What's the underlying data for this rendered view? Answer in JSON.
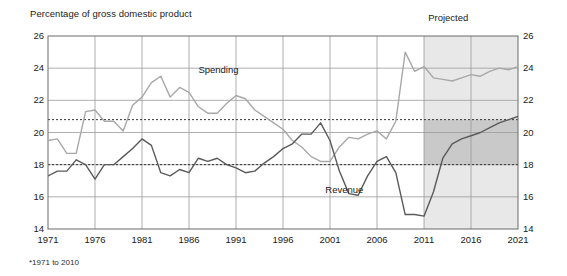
{
  "chart_data": {
    "type": "line",
    "title": "",
    "ylabel": "Percentage of gross domestic product",
    "xlabel": "",
    "ylim": [
      14,
      26
    ],
    "yticks": [
      14,
      16,
      18,
      20,
      22,
      24,
      26
    ],
    "xlim": [
      1971,
      2021
    ],
    "xticks": [
      1971,
      1976,
      1981,
      1986,
      1991,
      1996,
      2001,
      2006,
      2011,
      2016,
      2021
    ],
    "grid": true,
    "legend_position": "inline-annotation",
    "annotations": [
      {
        "name": "projected",
        "text": "Projected",
        "x": 2014,
        "y": 26.4
      },
      {
        "name": "spending",
        "text": "Spending",
        "x": 1987,
        "y": 23.9
      },
      {
        "name": "revenue",
        "text": "Revenue",
        "x": 2000.5,
        "y": 16.4
      }
    ],
    "footnote": "*1971 to 2010",
    "reference_lines": [
      {
        "name": "average-spending",
        "value": 20.8,
        "style": "dotted"
      },
      {
        "name": "average-revenue",
        "value": 18.0,
        "style": "dotted"
      }
    ],
    "projection_start": 2011,
    "series": [
      {
        "name": "Spending",
        "color": "#a8a8a8",
        "x": [
          1971,
          1972,
          1973,
          1974,
          1975,
          1976,
          1977,
          1978,
          1979,
          1980,
          1981,
          1982,
          1983,
          1984,
          1985,
          1986,
          1987,
          1988,
          1989,
          1990,
          1991,
          1992,
          1993,
          1994,
          1995,
          1996,
          1997,
          1998,
          1999,
          2000,
          2001,
          2002,
          2003,
          2004,
          2005,
          2006,
          2007,
          2008,
          2009,
          2010,
          2011,
          2012,
          2013,
          2014,
          2015,
          2016,
          2017,
          2018,
          2019,
          2020,
          2021
        ],
        "values": [
          19.5,
          19.6,
          18.7,
          18.7,
          21.3,
          21.4,
          20.7,
          20.7,
          20.1,
          21.7,
          22.2,
          23.1,
          23.5,
          22.2,
          22.8,
          22.5,
          21.6,
          21.2,
          21.2,
          21.8,
          22.3,
          22.1,
          21.4,
          21.0,
          20.6,
          20.2,
          19.5,
          19.1,
          18.5,
          18.2,
          18.2,
          19.1,
          19.7,
          19.6,
          19.9,
          20.1,
          19.6,
          20.7,
          25.0,
          23.8,
          24.1,
          23.4,
          23.3,
          23.2,
          23.4,
          23.6,
          23.5,
          23.8,
          24.0,
          23.9,
          24.1
        ]
      },
      {
        "name": "Revenue",
        "color": "#5a5a5a",
        "x": [
          1971,
          1972,
          1973,
          1974,
          1975,
          1976,
          1977,
          1978,
          1979,
          1980,
          1981,
          1982,
          1983,
          1984,
          1985,
          1986,
          1987,
          1988,
          1989,
          1990,
          1991,
          1992,
          1993,
          1994,
          1995,
          1996,
          1997,
          1998,
          1999,
          2000,
          2001,
          2002,
          2003,
          2004,
          2005,
          2006,
          2007,
          2008,
          2009,
          2010,
          2011,
          2012,
          2013,
          2014,
          2015,
          2016,
          2017,
          2018,
          2019,
          2020,
          2021
        ],
        "values": [
          17.3,
          17.6,
          17.6,
          18.3,
          18.0,
          17.1,
          18.0,
          18.0,
          18.5,
          19.0,
          19.6,
          19.2,
          17.5,
          17.3,
          17.7,
          17.5,
          18.4,
          18.2,
          18.4,
          18.0,
          17.8,
          17.5,
          17.6,
          18.1,
          18.5,
          19.0,
          19.3,
          19.9,
          19.9,
          20.6,
          19.5,
          17.6,
          16.2,
          16.1,
          17.3,
          18.2,
          18.5,
          17.5,
          14.9,
          14.9,
          14.8,
          16.3,
          18.4,
          19.3,
          19.6,
          19.8,
          20.0,
          20.3,
          20.6,
          20.8,
          21.0
        ]
      }
    ]
  },
  "axis": {
    "title": "Percentage of gross domestic product",
    "y_tick_labels": [
      "26",
      "24",
      "22",
      "20",
      "18",
      "16",
      "14"
    ],
    "x_tick_labels": [
      "1971",
      "1976",
      "1981",
      "1986",
      "1991",
      "1996",
      "2001",
      "2006",
      "2011",
      "2016",
      "2021"
    ]
  },
  "labels": {
    "projected": "Projected",
    "spending": "Spending",
    "revenue": "Revenue",
    "footnote": "*1971 to 2010"
  },
  "colors": {
    "spending_line": "#a8a8a8",
    "revenue_line": "#5a5a5a",
    "grid": "#9a9a9a",
    "frame": "#6b6b6b",
    "projected_shade_light": "#e8e8e8",
    "projected_shade_dark": "#c9c9c9",
    "text": "#1a1a1a"
  }
}
